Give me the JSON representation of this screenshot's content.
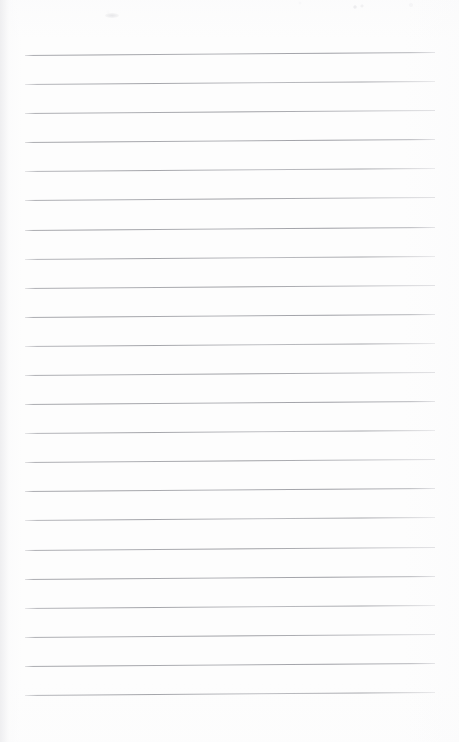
{
  "document": {
    "kind": "scanned-lined-paper",
    "title": "Blank ruled notepad page",
    "orientation": "portrait",
    "page_width_px": 459,
    "page_height_px": 742,
    "has_text": false,
    "visible_text": "",
    "paper_color": "#fdfdfd",
    "background_color": "#ffffff"
  },
  "ruling": {
    "line_color": "#a6a7ac",
    "line_thickness_px": 1,
    "line_count": 23,
    "line_left_x_px": 25,
    "line_right_x_px": 435,
    "line_length_px": 410,
    "first_line_y_px": 55,
    "last_line_y_px": 695,
    "line_spacing_px": 29.1,
    "slant_degrees": -0.42,
    "top_margin_px": 55,
    "bottom_margin_px": 47,
    "left_margin_px": 25,
    "right_margin_px": 24,
    "lines": [
      {
        "index": 1,
        "y": 55,
        "content": ""
      },
      {
        "index": 2,
        "y": 84,
        "content": ""
      },
      {
        "index": 3,
        "y": 113,
        "content": ""
      },
      {
        "index": 4,
        "y": 142,
        "content": ""
      },
      {
        "index": 5,
        "y": 171,
        "content": ""
      },
      {
        "index": 6,
        "y": 200,
        "content": ""
      },
      {
        "index": 7,
        "y": 230,
        "content": ""
      },
      {
        "index": 8,
        "y": 259,
        "content": ""
      },
      {
        "index": 9,
        "y": 288,
        "content": ""
      },
      {
        "index": 10,
        "y": 317,
        "content": ""
      },
      {
        "index": 11,
        "y": 346,
        "content": ""
      },
      {
        "index": 12,
        "y": 375,
        "content": ""
      },
      {
        "index": 13,
        "y": 404,
        "content": ""
      },
      {
        "index": 14,
        "y": 433,
        "content": ""
      },
      {
        "index": 15,
        "y": 462,
        "content": ""
      },
      {
        "index": 16,
        "y": 491,
        "content": ""
      },
      {
        "index": 17,
        "y": 520,
        "content": ""
      },
      {
        "index": 18,
        "y": 550,
        "content": ""
      },
      {
        "index": 19,
        "y": 579,
        "content": ""
      },
      {
        "index": 20,
        "y": 608,
        "content": ""
      },
      {
        "index": 21,
        "y": 637,
        "content": ""
      },
      {
        "index": 22,
        "y": 666,
        "content": ""
      },
      {
        "index": 23,
        "y": 695,
        "content": ""
      }
    ]
  },
  "artifacts": {
    "top_speckle_visible": true,
    "left_edge_shadow_visible": true,
    "smudge_visible": true
  }
}
